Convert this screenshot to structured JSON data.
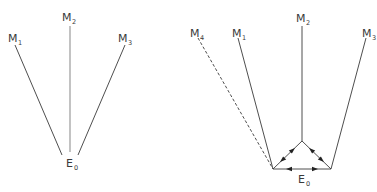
{
  "left_diagram": {
    "nodes": [
      {
        "id": "M1",
        "base": "M",
        "sub": "1",
        "x": 10,
        "y": 41
      },
      {
        "id": "M2",
        "base": "M",
        "sub": "2",
        "x": 64,
        "y": 21
      },
      {
        "id": "M3",
        "base": "M",
        "sub": "3",
        "x": 120,
        "y": 41
      },
      {
        "id": "E0",
        "base": "E",
        "sub": "0",
        "x": 67,
        "y": 163
      }
    ],
    "edges": [
      {
        "from": "M1",
        "to": "E0",
        "style": "solid"
      },
      {
        "from": "M2",
        "to": "E0",
        "style": "solid"
      },
      {
        "from": "M3",
        "to": "E0",
        "style": "solid"
      }
    ]
  },
  "right_diagram": {
    "nodes": [
      {
        "id": "M4",
        "base": "M",
        "sub": "4",
        "x": 190,
        "y": 33
      },
      {
        "id": "M1",
        "base": "M",
        "sub": "1",
        "x": 232,
        "y": 33
      },
      {
        "id": "M2",
        "base": "M",
        "sub": "2",
        "x": 297,
        "y": 21
      },
      {
        "id": "M3",
        "base": "M",
        "sub": "3",
        "x": 363,
        "y": 33
      },
      {
        "id": "E0",
        "base": "E",
        "sub": "0",
        "x": 299,
        "y": 182
      }
    ],
    "edges": [
      {
        "from": "M4",
        "to": "E0-left-vertex",
        "style": "dashed"
      },
      {
        "from": "M1",
        "to": "E0-left-vertex",
        "style": "solid"
      },
      {
        "from": "M2",
        "to": "E0-top-vertex",
        "style": "solid"
      },
      {
        "from": "M3",
        "to": "E0-right-vertex",
        "style": "solid"
      }
    ],
    "triangle": {
      "label": "E0",
      "vertices": {
        "left": [
          273,
          169
        ],
        "top": [
          302,
          141
        ],
        "right": [
          331,
          169
        ]
      },
      "arrows": "bidirectional on each edge"
    }
  },
  "colors": {
    "line": "#3a3a3a",
    "left_center_line": "#9a9a9a",
    "text": "#3a3a3a"
  }
}
